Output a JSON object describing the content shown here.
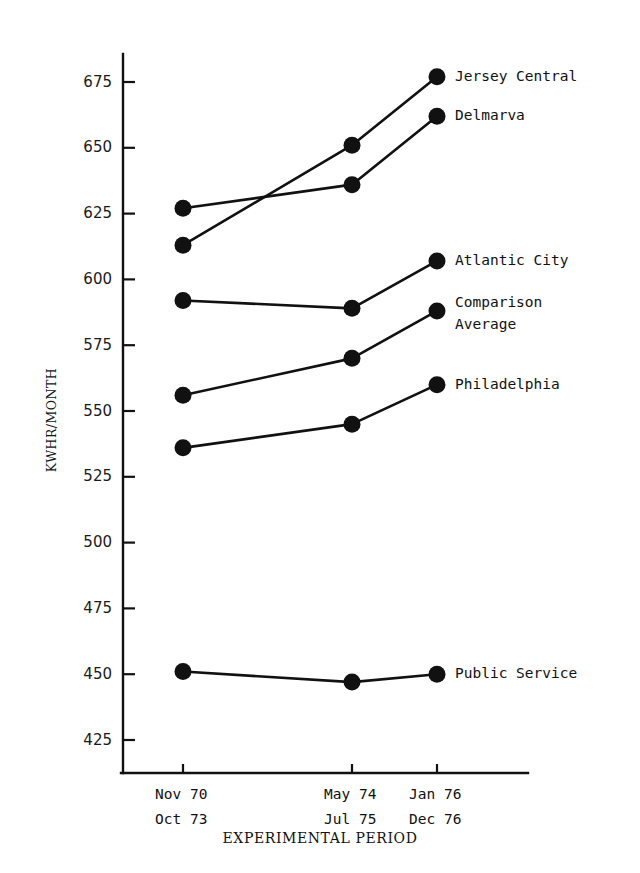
{
  "chart_data": {
    "type": "line",
    "title": "",
    "xlabel": "EXPERIMENTAL PERIOD",
    "ylabel": "KWHR/MONTH",
    "ylim": [
      418,
      685
    ],
    "yticks": [
      425,
      450,
      475,
      500,
      525,
      550,
      575,
      600,
      625,
      650,
      675
    ],
    "ytick_labels": [
      "425",
      "450",
      "475",
      "500",
      "525",
      "550",
      "575",
      "600",
      "625",
      "650",
      "675"
    ],
    "grid": false,
    "legend_position": "right-inline-labels",
    "categories": [
      "Nov 70 / Oct 73",
      "May 74 / Jul 75",
      "Jan 76 / Dec 76"
    ],
    "xtick_labels": [
      {
        "line1": "Nov  70",
        "line2": "Oct  73"
      },
      {
        "line1": "May  74",
        "line2": "Jul  75"
      },
      {
        "line1": "Jan  76",
        "line2": "Dec  76"
      }
    ],
    "series": [
      {
        "name": "Jersey Central",
        "values": [
          613,
          651,
          677
        ]
      },
      {
        "name": "Delmarva",
        "values": [
          627,
          636,
          662
        ]
      },
      {
        "name": "Atlantic City",
        "values": [
          592,
          589,
          607
        ]
      },
      {
        "name": "Comparison Average",
        "label_lines": [
          "Comparison",
          "Average"
        ],
        "values": [
          556,
          570,
          588
        ]
      },
      {
        "name": "Philadelphia",
        "values": [
          536,
          545,
          560
        ]
      },
      {
        "name": "Public Service",
        "values": [
          451,
          447,
          450
        ]
      }
    ],
    "marker": "filled-circle",
    "line_color": "#111111",
    "marker_color": "#111111",
    "background_color": "#ffffff"
  }
}
